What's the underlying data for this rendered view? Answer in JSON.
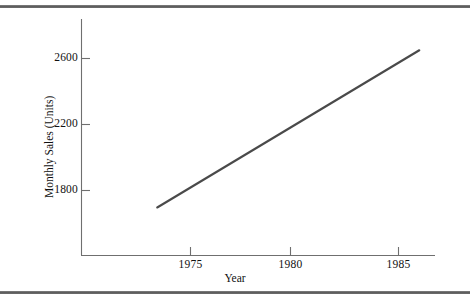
{
  "figure": {
    "background": "#ffffff",
    "rule_color": "#5a5a5a",
    "top_rule_name": "top-horizontal-rule",
    "bottom_rule_name": "bottom-horizontal-rule"
  },
  "chart_data": {
    "type": "line",
    "title": "",
    "subtitle": "",
    "xlabel": "Year",
    "ylabel": "Monthly Sales (Units)",
    "xlim": [
      1972.0,
      1987.0
    ],
    "ylim": [
      1600,
      2700
    ],
    "xticks": [
      1975,
      1980,
      1985
    ],
    "xtick_labels": [
      "1975",
      "1980",
      "1985"
    ],
    "yticks": [
      1800,
      2200,
      2600
    ],
    "ytick_labels": [
      "1800",
      "2200",
      "2600"
    ],
    "grid": false,
    "legend": null,
    "legend_position": "none",
    "line_color": "#4a4a4a",
    "axis_color": "#6f6f6f",
    "series": [
      {
        "name": "Monthly Sales",
        "x": [
          1973.4,
          1986.0
        ],
        "values": [
          1697,
          2650
        ]
      }
    ],
    "annotations": []
  }
}
